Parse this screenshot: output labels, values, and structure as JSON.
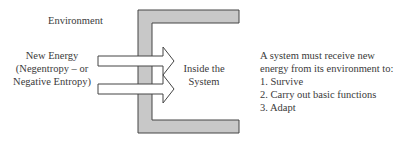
{
  "diagram": {
    "environment_label": "Environment",
    "input_label": {
      "line1": "New Energy",
      "line2": "(Negentropy – or",
      "line3": "Negative Entropy)"
    },
    "system_label": {
      "line1": "Inside the",
      "line2": "System"
    },
    "description": {
      "intro_line1": "A system must receive new",
      "intro_line2": "energy from its environment to:",
      "items": [
        "1. Survive",
        "2. Carry out basic functions",
        "3. Adapt"
      ]
    },
    "colors": {
      "boundary_fill": "#c8c8c8",
      "stroke": "#444444",
      "arrow_fill": "#ffffff"
    }
  }
}
